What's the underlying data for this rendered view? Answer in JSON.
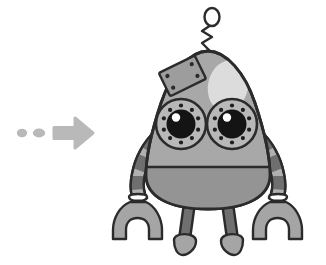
{
  "scene": {
    "title": "Robot mascot illustration with pointer arrow",
    "background_color": "#ffffff",
    "width": 326,
    "height": 265,
    "style": "grayscale cartoon line art"
  },
  "palette": {
    "outline": "#2b2b2b",
    "body_light": "#a8a8a8",
    "body_mid": "#9a9a9a",
    "body_dark": "#8e8e8e",
    "limb_light": "#b0b0b0",
    "limb_dark": "#6f6f6f",
    "panel": "#9d9d9d",
    "highlight": "#dcdcdc",
    "eye_ring": "#b8b8b8",
    "pupil": "#141414",
    "pupil_glint": "#ffffff",
    "cuff": "#ffffff",
    "arrow": "#b9b9b9",
    "foot": "#a5a5a5"
  },
  "pointer": {
    "label": "motion arrow pointing right",
    "color": "#b9b9b9",
    "dots": [
      {
        "name": "trail-dot-1",
        "cx": 22,
        "cy": 133,
        "rx": 5,
        "ry": 4
      },
      {
        "name": "trail-dot-2",
        "cx": 38,
        "cy": 133,
        "rx": 6,
        "ry": 4
      }
    ],
    "arrow_head_label": "arrow-head",
    "arrow_shaft_label": "arrow-shaft"
  },
  "robot": {
    "name": "robot",
    "parts": [
      {
        "id": "antenna",
        "label": "Antenna",
        "description": "zigzag stem with oval loop finial"
      },
      {
        "id": "head-body",
        "label": "Head and body",
        "description": "egg shaped shell"
      },
      {
        "id": "highlight",
        "label": "Shine highlight",
        "description": "pale ellipse upper right of head"
      },
      {
        "id": "access-panel",
        "label": "Access panel",
        "description": "tilted rectangle with four screws"
      },
      {
        "id": "left-eye",
        "label": "Left eye",
        "description": "riveted ring with black pupil"
      },
      {
        "id": "right-eye",
        "label": "Right eye",
        "description": "riveted ring with black pupil"
      },
      {
        "id": "belly-seam",
        "label": "Belly seam",
        "description": "horizontal divider line across torso"
      },
      {
        "id": "left-arm",
        "label": "Left arm",
        "description": "segmented striped arm"
      },
      {
        "id": "right-arm",
        "label": "Right arm",
        "description": "segmented striped arm"
      },
      {
        "id": "left-claw",
        "label": "Left claw",
        "description": "U shaped pincer with white cuff"
      },
      {
        "id": "right-claw",
        "label": "Right claw",
        "description": "U shaped pincer with white cuff"
      },
      {
        "id": "left-leg",
        "label": "Left leg",
        "description": "dark tapered post"
      },
      {
        "id": "right-leg",
        "label": "Right leg",
        "description": "dark tapered post"
      },
      {
        "id": "left-foot",
        "label": "Left foot",
        "description": "rounded oval foot"
      },
      {
        "id": "right-foot",
        "label": "Right foot",
        "description": "rounded oval foot"
      }
    ],
    "eyes": {
      "rivet_count": 10,
      "left": {
        "cx": 181,
        "cy": 124,
        "ring_r": 25,
        "pupil_r": 15,
        "glint_cx": 176,
        "glint_cy": 117,
        "glint_r": 4.2
      },
      "right": {
        "cx": 232,
        "cy": 124,
        "ring_r": 25,
        "pupil_r": 15,
        "glint_cx": 227,
        "glint_cy": 117,
        "glint_r": 4.2
      }
    },
    "panel_screw_count": 4,
    "arm_segment_count": 7
  }
}
